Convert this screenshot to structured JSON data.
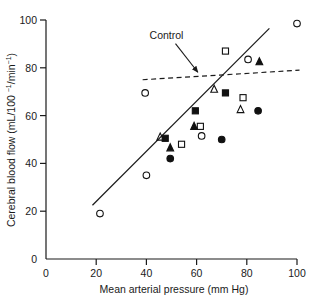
{
  "chart_data": {
    "type": "scatter",
    "title": "",
    "xlabel": "Mean arterial pressure (mm Hg)",
    "ylabel": "Cerebral blood flow (mL/100 ⁻¹/min⁻¹)",
    "ylabel_parts": {
      "main": "Cerebral blood flow (mL/100 ",
      "sup1": "−1",
      "mid": "/min",
      "sup2": "−1",
      "close": ")"
    },
    "xlim": [
      0,
      100
    ],
    "ylim": [
      0,
      100
    ],
    "xticks": [
      0,
      20,
      40,
      60,
      80,
      100
    ],
    "yticks": [
      0,
      20,
      40,
      60,
      80,
      100
    ],
    "xtick_labels": [
      "0",
      "20",
      "40",
      "60",
      "80",
      "100"
    ],
    "ytick_labels": [
      "0",
      "20",
      "40",
      "60",
      "80",
      "100"
    ],
    "grid": false,
    "legend": "none",
    "series": [
      {
        "name": "open-circle",
        "marker": "open-circle",
        "points": [
          {
            "x": 21.5,
            "y": 19.0
          },
          {
            "x": 40.0,
            "y": 35.0
          },
          {
            "x": 39.5,
            "y": 69.5
          },
          {
            "x": 62.0,
            "y": 51.5
          },
          {
            "x": 80.5,
            "y": 83.5
          },
          {
            "x": 100.0,
            "y": 98.5
          }
        ]
      },
      {
        "name": "filled-circle",
        "marker": "filled-circle",
        "points": [
          {
            "x": 49.5,
            "y": 42.0
          },
          {
            "x": 70.0,
            "y": 50.0
          },
          {
            "x": 84.5,
            "y": 62.0
          }
        ]
      },
      {
        "name": "open-square",
        "marker": "open-square",
        "points": [
          {
            "x": 54.0,
            "y": 48.0
          },
          {
            "x": 61.5,
            "y": 55.5
          },
          {
            "x": 71.5,
            "y": 87.0
          },
          {
            "x": 78.5,
            "y": 67.5
          }
        ]
      },
      {
        "name": "filled-square",
        "marker": "filled-square",
        "points": [
          {
            "x": 47.5,
            "y": 50.5
          },
          {
            "x": 59.5,
            "y": 62.0
          },
          {
            "x": 71.5,
            "y": 69.5
          }
        ]
      },
      {
        "name": "open-triangle",
        "marker": "open-triangle",
        "points": [
          {
            "x": 45.5,
            "y": 51.0
          },
          {
            "x": 67.0,
            "y": 71.0
          },
          {
            "x": 77.5,
            "y": 62.5
          }
        ]
      },
      {
        "name": "filled-triangle",
        "marker": "filled-triangle",
        "points": [
          {
            "x": 49.5,
            "y": 46.5
          },
          {
            "x": 59.0,
            "y": 55.5
          },
          {
            "x": 85.0,
            "y": 82.5
          }
        ]
      }
    ],
    "lines": [
      {
        "name": "regression-line",
        "style": "solid",
        "x0": 18.5,
        "y0": 22.5,
        "x1": 89.0,
        "y1": 96.5
      },
      {
        "name": "control-line",
        "style": "dashed",
        "x0": 38.5,
        "y0": 75.0,
        "x1": 101.0,
        "y1": 79.0
      }
    ],
    "annotations": [
      {
        "name": "control-label",
        "text": "Control",
        "x": 48.0,
        "y": 92.0,
        "arrow_to": {
          "x": 60.5,
          "y": 77.5
        }
      }
    ]
  }
}
